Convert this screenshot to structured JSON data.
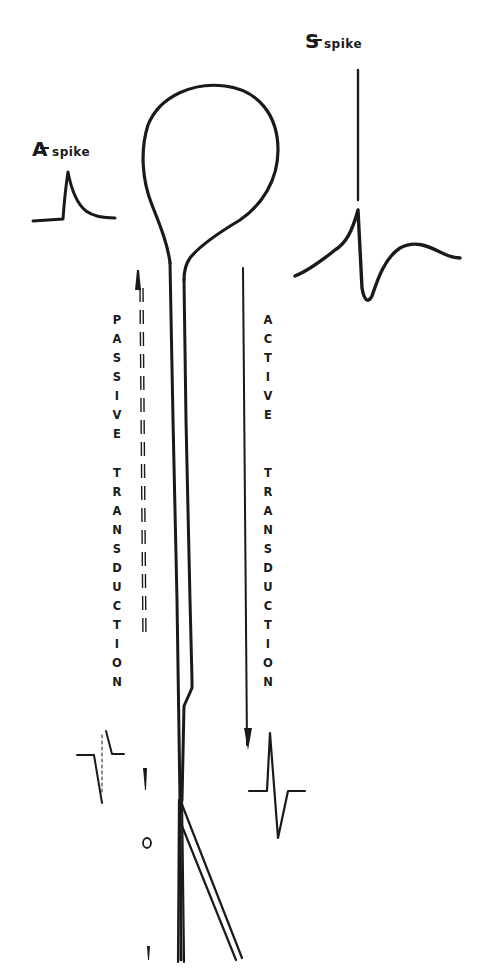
{
  "diagram": {
    "type": "neuron-spike-transduction",
    "labels": {
      "a_spike": {
        "letter": "A",
        "text": "spike"
      },
      "s_spike": {
        "letter": "S",
        "text": "spike"
      },
      "passive": "PASSIVE",
      "active": "ACTIVE",
      "transduction_left": "TRANSDUCTION",
      "transduction_right": "TRANSDUCTION"
    },
    "nodes": [
      {
        "id": "soma",
        "label": "cell body (loop)"
      },
      {
        "id": "a-spike-trace",
        "label": "A spike waveform"
      },
      {
        "id": "s-spike-trace",
        "label": "S spike waveform"
      },
      {
        "id": "axon",
        "label": "axon (double line)"
      },
      {
        "id": "passive-arrow",
        "label": "passive transduction (dashed)"
      },
      {
        "id": "active-arrow",
        "label": "active transduction (solid)"
      },
      {
        "id": "recorded-passive",
        "label": "attenuated passive waveform"
      },
      {
        "id": "recorded-active",
        "label": "propagated active waveform"
      }
    ],
    "colors": {
      "ink": "#1a1a1a",
      "background": "#ffffff"
    }
  }
}
